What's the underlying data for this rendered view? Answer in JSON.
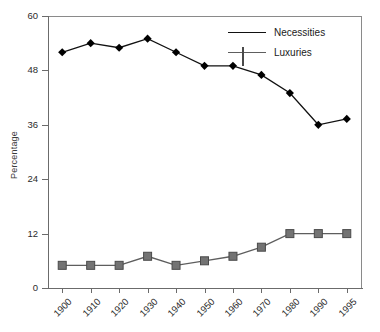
{
  "chart_data": {
    "type": "line",
    "title": "",
    "xlabel": "",
    "ylabel": "Percentage",
    "categories": [
      "1900",
      "1910",
      "1920",
      "1930",
      "1940",
      "1950",
      "1960",
      "1970",
      "1980",
      "1990",
      "1995"
    ],
    "ylim": [
      0,
      60
    ],
    "yticks": [
      0,
      12,
      24,
      36,
      48,
      60
    ],
    "grid": false,
    "legend_position": "top-right",
    "series": [
      {
        "name": "Necessities",
        "marker": "diamond",
        "color": "#000000",
        "values": [
          52.0,
          54.0,
          53.0,
          55.0,
          52.0,
          49.0,
          49.0,
          47.0,
          43.0,
          36.0,
          37.3
        ]
      },
      {
        "name": "Luxuries",
        "marker": "square",
        "color": "#737373",
        "values": [
          5.0,
          5.0,
          5.0,
          7.0,
          5.0,
          6.0,
          7.0,
          9.0,
          12.0,
          12.0,
          12.0
        ]
      }
    ]
  },
  "axis": {
    "ytick_labels": [
      "0",
      "12",
      "24",
      "36",
      "48",
      "60"
    ],
    "ylabel_text": "Percentage"
  },
  "legend": {
    "items": [
      {
        "label": "Necessities"
      },
      {
        "label": "Luxuries"
      }
    ]
  }
}
